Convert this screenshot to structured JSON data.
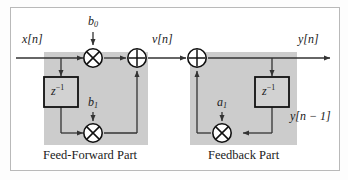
{
  "figure": {
    "type": "signal-flow-block-diagram"
  },
  "colors": {
    "shade": "#cccccc",
    "line": "#333333",
    "block_fill": "#d2d2d2",
    "block_stroke": "#111111",
    "text": "#1a1a1a",
    "frame": "#b9b9b9",
    "background": "#ffffff"
  },
  "signals": {
    "input": "x[n]",
    "intermediate": "v[n]",
    "output": "y[n]",
    "delayed_output": "y[n − 1]"
  },
  "coefficients": {
    "b0": "b",
    "b0_sub": "0",
    "b1": "b",
    "b1_sub": "1",
    "a1": "a",
    "a1_sub": "1"
  },
  "delay_blocks": [
    {
      "name": "feedforward-delay",
      "base": "z",
      "exponent": "−1"
    },
    {
      "name": "feedback-delay",
      "base": "z",
      "exponent": "−1"
    }
  ],
  "operators": {
    "multiply": "⊗",
    "add": "⊕"
  },
  "captions": {
    "left": "Feed-Forward Part",
    "right": "Feedback Part"
  }
}
